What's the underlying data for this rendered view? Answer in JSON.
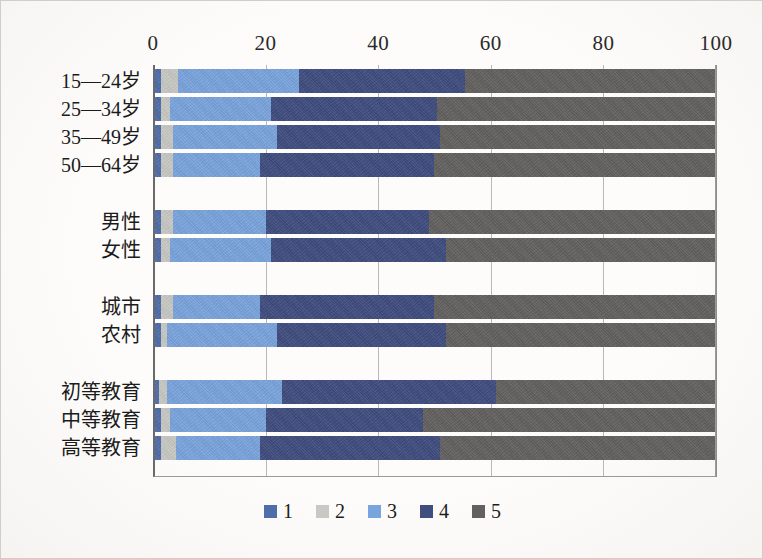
{
  "chart_data": {
    "type": "bar",
    "orientation": "horizontal",
    "stacked": true,
    "stack_mode": "percent",
    "title": "",
    "subtitle": "",
    "xlabel": "",
    "ylabel": "",
    "xlim": [
      0,
      100
    ],
    "xticks": [
      0,
      20,
      40,
      60,
      80,
      100
    ],
    "xtick_labels": [
      "0",
      "20",
      "40",
      "60",
      "80",
      "100"
    ],
    "grid": true,
    "grid_axis": "x",
    "legend_position": "bottom",
    "legend": [
      "1",
      "2",
      "3",
      "4",
      "5"
    ],
    "series_colors": [
      "#4f6daa",
      "#c8c8c4",
      "#7aa4dd",
      "#3f4d7f",
      "#636160"
    ],
    "categories": [
      "15—24岁",
      "25—34岁",
      "35—49岁",
      "50—64岁",
      "男性",
      "女性",
      "城市",
      "农村",
      "初等教育",
      "中等教育",
      "高等教育"
    ],
    "group_breaks_after": [
      "50—64岁",
      "女性",
      "农村"
    ],
    "series": [
      {
        "name": "1",
        "values": [
          1.5,
          1.5,
          1.5,
          1.5,
          1.5,
          1.5,
          1.5,
          1.5,
          1.0,
          1.5,
          1.5
        ]
      },
      {
        "name": "2",
        "values": [
          3.0,
          1.5,
          2.0,
          2.0,
          2.0,
          1.5,
          2.0,
          1.0,
          1.5,
          1.5,
          2.5
        ]
      },
      {
        "name": "3",
        "values": [
          21.5,
          18.0,
          18.5,
          15.5,
          16.5,
          18.0,
          15.5,
          19.5,
          20.5,
          17.0,
          15.0
        ]
      },
      {
        "name": "4",
        "values": [
          29.5,
          29.5,
          29.0,
          31.0,
          29.0,
          31.0,
          31.0,
          30.0,
          38.0,
          28.0,
          32.0
        ]
      },
      {
        "name": "5",
        "values": [
          44.5,
          49.5,
          49.0,
          50.0,
          51.0,
          48.0,
          50.0,
          48.0,
          39.0,
          52.0,
          49.0
        ]
      }
    ]
  }
}
